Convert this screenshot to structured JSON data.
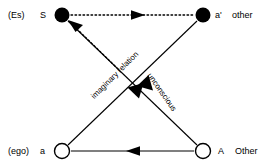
{
  "diagram": {
    "background": "#ffffff",
    "stroke": "#000000",
    "nodes": [
      {
        "id": "S",
        "symbol": "S",
        "aux_label": "(Es)",
        "fill": "filled",
        "x": 62,
        "y": 15
      },
      {
        "id": "a1",
        "symbol": "a'",
        "aux_label": "other",
        "fill": "filled",
        "x": 203,
        "y": 15
      },
      {
        "id": "a",
        "symbol": "a",
        "aux_label": "(ego)",
        "fill": "hollow",
        "x": 62,
        "y": 151
      },
      {
        "id": "A",
        "symbol": "A",
        "aux_label": "Other",
        "fill": "hollow",
        "x": 203,
        "y": 151
      }
    ],
    "labels": {
      "es": "(Es)",
      "s": "S",
      "a_prime": "a'",
      "other_lower": "other",
      "ego": "(ego)",
      "a": "a",
      "capital_a": "A",
      "other_upper": "Other"
    },
    "edges": [
      {
        "id": "s-to-aprime",
        "from": "S",
        "to": "a1",
        "style": "dotted",
        "arrow": "mid-right",
        "label": ""
      },
      {
        "id": "aprime-to-a",
        "from": "a1",
        "to": "a",
        "style": "solid",
        "arrow": "mid-down-left",
        "label": "imaginary relation"
      },
      {
        "id": "A-to-S",
        "from": "A",
        "to": "S",
        "style": "solid",
        "arrow": "mid-up-left",
        "label": "unconscious"
      },
      {
        "id": "A-to-a",
        "from": "A",
        "to": "a",
        "style": "solid",
        "arrow": "mid-left",
        "label": ""
      },
      {
        "id": "broken-to-S",
        "from": "mid",
        "to": "S",
        "style": "dotted",
        "arrow": "end-up-left",
        "label": ""
      }
    ],
    "edge_labels": {
      "imaginary_relation": "imaginary relation",
      "unconscious": "unconscious"
    }
  }
}
